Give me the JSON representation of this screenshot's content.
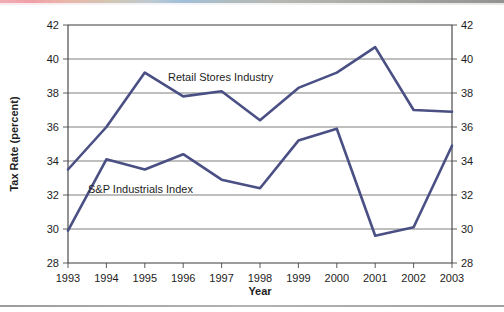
{
  "chart_data": {
    "type": "line",
    "title": "",
    "xlabel": "Year",
    "ylabel": "Tax Rate (percent)",
    "categories": [
      "1993",
      "1994",
      "1995",
      "1996",
      "1997",
      "1998",
      "1999",
      "2000",
      "2001",
      "2002",
      "2003"
    ],
    "xlim": [
      "1993",
      "2003"
    ],
    "ylim": [
      28,
      42
    ],
    "ytick_labels": [
      "28",
      "30",
      "32",
      "34",
      "36",
      "38",
      "40",
      "42"
    ],
    "ytick_values": [
      28,
      30,
      32,
      34,
      36,
      38,
      40,
      42
    ],
    "grid": "horizontal",
    "legend_position": "inline-annotations",
    "dual_y_axis": true,
    "series": [
      {
        "name": "Retail Stores Industry",
        "color": "#4a4f84",
        "values": [
          33.5,
          36.0,
          39.2,
          37.8,
          38.1,
          36.4,
          38.3,
          39.2,
          40.7,
          37.0,
          36.9
        ],
        "label_x_category": "1996",
        "label_value": 39.0
      },
      {
        "name": "S&P Industrials Index",
        "color": "#4a4f84",
        "values": [
          29.9,
          34.1,
          33.5,
          34.4,
          32.9,
          32.4,
          35.2,
          35.9,
          29.6,
          30.1,
          34.9
        ],
        "label_x_category": "1995",
        "label_value": 32.9
      }
    ]
  },
  "axes": {
    "left_tick_labels": [
      "42",
      "40",
      "38",
      "36",
      "34",
      "32",
      "30",
      "28"
    ],
    "right_tick_labels": [
      "42",
      "40",
      "38",
      "36",
      "34",
      "32",
      "30",
      "28"
    ],
    "x_tick_labels": [
      "1993",
      "1994",
      "1995",
      "1996",
      "1997",
      "1998",
      "1999",
      "2000",
      "2001",
      "2002",
      "2003"
    ],
    "y_axis_title": "Tax Rate (percent)",
    "x_axis_title": "Year"
  },
  "annotations": [
    {
      "text": "Retail Stores Industry"
    },
    {
      "text": "S&P Industrials Index"
    }
  ],
  "colors": {
    "series_line": "#4a4f84",
    "gridline": "#6f6f6f",
    "axis": "#3b3b3b",
    "background": "#ffffff",
    "text": "#1d1d1d"
  }
}
